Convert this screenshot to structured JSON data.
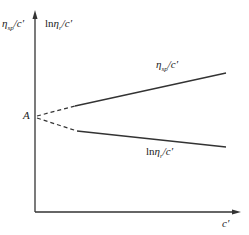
{
  "diagram": {
    "y_axis_label_left": {
      "main": "η",
      "sub": "sp",
      "tail": "/c′"
    },
    "y_axis_label_right": {
      "prefix": "ln",
      "main": "η",
      "sub": "r",
      "tail": "/c′"
    },
    "x_axis_label": "c′",
    "intercept_label": "A",
    "upper_line_label": {
      "main": "η",
      "sub": "sp",
      "tail": "/c′"
    },
    "lower_line_label": {
      "prefix": "ln",
      "main": "η",
      "sub": "r",
      "tail": "/c′"
    },
    "colors": {
      "line": "#333333",
      "background": "#ffffff"
    }
  }
}
